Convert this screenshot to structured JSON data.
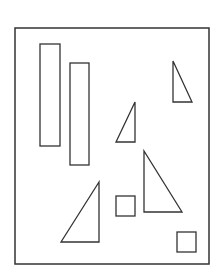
{
  "diagram": {
    "width": 221,
    "height": 270,
    "stroke_color": "#333333",
    "background": "#ffffff",
    "frame": {
      "x": 15,
      "y": 28,
      "w": 194,
      "h": 236
    },
    "rectangles": [
      {
        "id": "tall-rect-1",
        "x": 40,
        "y": 44,
        "w": 20,
        "h": 102
      },
      {
        "id": "tall-rect-2",
        "x": 70,
        "y": 63,
        "w": 19,
        "h": 102
      }
    ],
    "squares": [
      {
        "id": "square-1",
        "x": 116,
        "y": 196,
        "w": 19,
        "h": 20
      },
      {
        "id": "square-2",
        "x": 177,
        "y": 232,
        "w": 19,
        "h": 20
      }
    ],
    "triangles": [
      {
        "id": "triangle-top-right",
        "points": "173,61 173,102 192,102"
      },
      {
        "id": "triangle-middle-small",
        "points": "135,102 116,142 135,142"
      },
      {
        "id": "triangle-right-large",
        "points": "144,151 144,212 182,212"
      },
      {
        "id": "triangle-bottom-left",
        "points": "99,182 61,242 99,242"
      }
    ]
  }
}
